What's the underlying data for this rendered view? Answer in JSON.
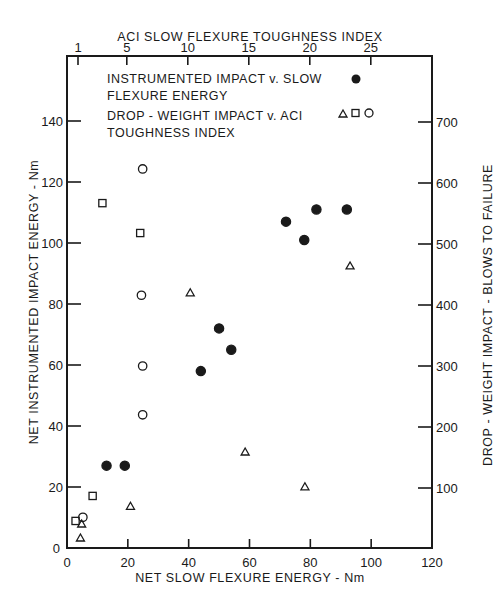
{
  "chart_data": {
    "type": "scatter",
    "title": "",
    "top_axis": {
      "label": "ACI SLOW FLEXURE TOUGHNESS INDEX",
      "ticks": [
        "1",
        "5",
        "10",
        "15",
        "20",
        "25"
      ],
      "tick_values": [
        1,
        5,
        10,
        15,
        20,
        25
      ]
    },
    "bottom_axis": {
      "label": "NET SLOW FLEXURE ENERGY - Nm",
      "ticks": [
        "0",
        "20",
        "40",
        "60",
        "80",
        "100",
        "120"
      ],
      "range": [
        0,
        120
      ]
    },
    "left_axis": {
      "label": "NET INSTRUMENTED IMPACT ENERGY - Nm",
      "ticks": [
        "0",
        "20",
        "40",
        "60",
        "80",
        "100",
        "120",
        "140"
      ],
      "range": [
        0,
        160
      ]
    },
    "right_axis": {
      "label": "DROP - WEIGHT IMPACT - BLOWS TO FAILURE",
      "ticks": [
        "100",
        "200",
        "300",
        "400",
        "500",
        "600",
        "700"
      ],
      "range": [
        0,
        800
      ]
    },
    "grid": false,
    "legend": {
      "position": "upper-left inside",
      "entries": [
        {
          "line1": "INSTRUMENTED  IMPACT  v.  SLOW",
          "line2": "FLEXURE  ENERGY",
          "markers": [
            "filled-circle"
          ]
        },
        {
          "line1": "DROP - WEIGHT  IMPACT  v.  ACI",
          "line2": "TOUGHNESS  INDEX",
          "markers": [
            "triangle",
            "square",
            "circle"
          ]
        }
      ]
    },
    "series": [
      {
        "name": "Instrumented impact v. slow flexure energy",
        "marker": "filled-circle",
        "x_axis": "bottom",
        "y_axis": "left",
        "x": [
          13,
          19,
          44,
          54,
          50,
          72,
          78,
          82,
          92
        ],
        "y": [
          27,
          27,
          58,
          65,
          72,
          107,
          101,
          111,
          111
        ]
      },
      {
        "name": "Drop-weight impact v. ACI toughness index (circle)",
        "marker": "open-circle",
        "x_axis": "top",
        "y_axis": "right",
        "x": [
          6.3,
          6.2,
          6.3,
          6.3,
          1.4
        ],
        "y": [
          623,
          416,
          300,
          220,
          52
        ]
      },
      {
        "name": "Drop-weight impact v. ACI toughness index (square)",
        "marker": "open-square",
        "x_axis": "top",
        "y_axis": "right",
        "x": [
          3.0,
          6.1,
          2.2,
          0.8
        ],
        "y": [
          567,
          518,
          87,
          46
        ]
      },
      {
        "name": "Drop-weight impact v. ACI toughness index (triangle)",
        "marker": "open-triangle",
        "x_axis": "top",
        "y_axis": "right",
        "x": [
          10.2,
          23.3,
          14.7,
          19.6,
          5.3,
          1.3,
          1.2
        ],
        "y": [
          420,
          464,
          159,
          102,
          70,
          41,
          18
        ]
      }
    ]
  }
}
